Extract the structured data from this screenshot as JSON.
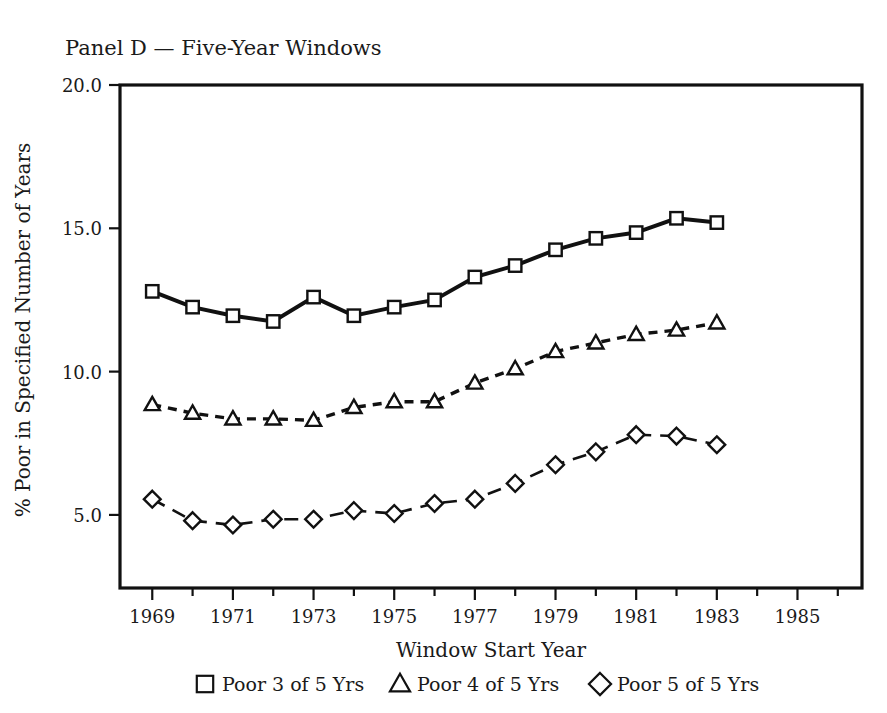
{
  "chart_data": {
    "type": "line",
    "title": "Panel D — Five-Year Windows",
    "xlabel": "Window Start Year",
    "ylabel": "% Poor in Specified Number of Years",
    "x": [
      1969,
      1970,
      1971,
      1972,
      1973,
      1974,
      1975,
      1976,
      1977,
      1978,
      1979,
      1980,
      1981,
      1982,
      1983
    ],
    "xlim": [
      1968.2,
      1986.6
    ],
    "ylim": [
      2.45,
      20.0
    ],
    "xticks": [
      1969,
      1971,
      1973,
      1975,
      1977,
      1979,
      1981,
      1983,
      1985
    ],
    "xtick_labels": [
      "1969",
      "1971",
      "1973",
      "1975",
      "1977",
      "1979",
      "1981",
      "1983",
      "1985"
    ],
    "xminorticks": [
      1970,
      1972,
      1974,
      1976,
      1978,
      1980,
      1982,
      1984,
      1986
    ],
    "yticks": [
      5.0,
      10.0,
      15.0,
      20.0
    ],
    "ytick_labels": [
      "5.0",
      "10.0",
      "15.0",
      "20.0"
    ],
    "grid": false,
    "legend_position": "below",
    "series": [
      {
        "name": "Poor 3 of 5 Yrs",
        "marker": "square",
        "linestyle": "solid",
        "values": [
          12.8,
          12.25,
          11.95,
          11.75,
          12.6,
          11.95,
          12.25,
          12.5,
          13.3,
          13.7,
          14.25,
          14.65,
          14.85,
          15.35,
          15.2
        ]
      },
      {
        "name": "Poor 4 of 5 Yrs",
        "marker": "triangle",
        "linestyle": "dashed",
        "values": [
          8.85,
          8.55,
          8.35,
          8.35,
          8.3,
          8.75,
          8.95,
          8.95,
          9.6,
          10.1,
          10.7,
          11.0,
          11.3,
          11.45,
          11.7
        ]
      },
      {
        "name": "Poor 5 of 5 Yrs",
        "marker": "diamond",
        "linestyle": "longdash",
        "values": [
          5.55,
          4.8,
          4.65,
          4.85,
          4.85,
          5.15,
          5.05,
          5.4,
          5.55,
          6.1,
          6.75,
          7.2,
          7.8,
          7.75,
          7.45
        ]
      }
    ]
  },
  "legend": {
    "items": [
      {
        "marker": "square",
        "label": "Poor 3 of 5 Yrs"
      },
      {
        "marker": "triangle",
        "label": "Poor 4 of 5 Yrs"
      },
      {
        "marker": "diamond",
        "label": "Poor 5 of 5 Yrs"
      }
    ]
  },
  "colors": {
    "ink": "#111111",
    "background": "#ffffff",
    "marker_fill": "#ffffff"
  }
}
